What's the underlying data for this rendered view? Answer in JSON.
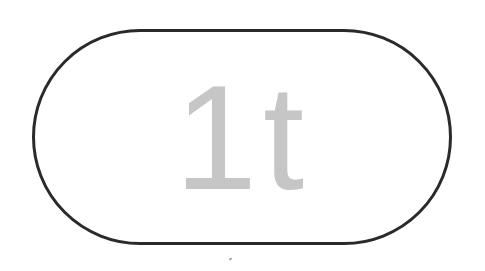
{
  "badge": {
    "label": "1t",
    "text_color": "#c6c6c6",
    "border_color": "#2a2a2a",
    "background_color": "#ffffff",
    "shape": "stadium"
  }
}
